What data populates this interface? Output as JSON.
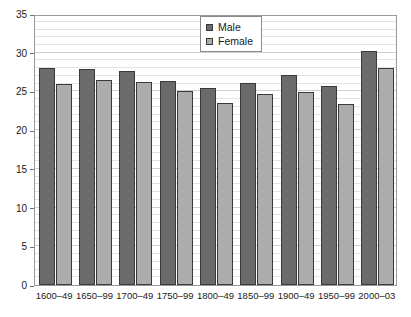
{
  "chart_data": {
    "type": "bar",
    "title": "",
    "subtitle": "",
    "xlabel": "",
    "ylabel": "",
    "ylim": [
      0,
      35
    ],
    "ytick_step": 5,
    "ytick_labels": [
      "0",
      "5",
      "10",
      "15",
      "20",
      "25",
      "30",
      "35"
    ],
    "grid": true,
    "grid_minor": true,
    "legend_position": "top-center-right",
    "categories": [
      "1600–49",
      "1650–99",
      "1700–49",
      "1750–99",
      "1800–49",
      "1850–99",
      "1900–49",
      "1950–99",
      "2000–03"
    ],
    "series": [
      {
        "name": "Male",
        "color": "#6b6b6b",
        "values": [
          28.0,
          27.9,
          27.6,
          26.4,
          25.4,
          26.1,
          27.1,
          25.7,
          30.2
        ]
      },
      {
        "name": "Female",
        "color": "#acacac",
        "values": [
          26.0,
          26.5,
          26.2,
          25.0,
          23.5,
          24.7,
          24.9,
          23.4,
          28.0
        ]
      }
    ]
  },
  "legend": {
    "entries": [
      {
        "label": "Male",
        "color": "#6b6b6b"
      },
      {
        "label": "Female",
        "color": "#acacac"
      }
    ]
  },
  "colors": {
    "male": "#6b6b6b",
    "female": "#acacac",
    "bar_border": "#3a3a3a",
    "plot_border": "#9a9a9a",
    "gridline_major": "#cfcfcf",
    "gridline_minor": "#e3e3e3",
    "text": "#1a1a1a",
    "background": "#ffffff"
  }
}
